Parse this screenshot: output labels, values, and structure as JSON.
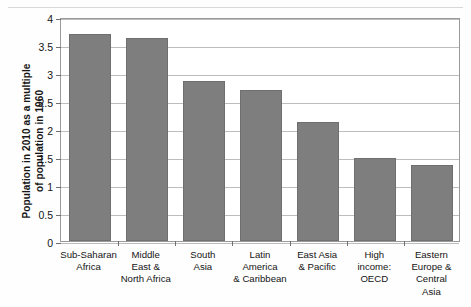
{
  "chart_data": {
    "type": "bar",
    "title": "",
    "subtitle": "",
    "xlabel": "",
    "ylabel": "Population in 2010 as a multiple of population in 1960",
    "ylabel_lines": [
      "Population in 2010 as a multiple",
      "of population in 1960"
    ],
    "ylim": [
      0,
      4
    ],
    "ytick_labels": [
      "0",
      "0.5",
      "1",
      "1.5",
      "2",
      "2.5",
      "3",
      "3.5",
      "4"
    ],
    "ytick_values": [
      0,
      0.5,
      1,
      1.5,
      2,
      2.5,
      3,
      3.5,
      4
    ],
    "grid": true,
    "legend": null,
    "bar_color": "#7e7e7e",
    "categories": [
      "Sub-Saharan Africa",
      "Middle East & North Africa",
      "South Asia",
      "Latin America & Caribbean",
      "East Asia & Pacific",
      "High income: OECD",
      "Eastern Europe & Central Asia"
    ],
    "category_lines": [
      [
        "Sub-Saharan",
        "Africa"
      ],
      [
        "Middle",
        "East &",
        "North Africa"
      ],
      [
        "South",
        "Asia"
      ],
      [
        "Latin",
        "America",
        "& Caribbean"
      ],
      [
        "East Asia",
        "& Pacific"
      ],
      [
        "High",
        "income:",
        "OECD"
      ],
      [
        "Eastern",
        "Europe &",
        "Central",
        "Asia"
      ]
    ],
    "values": [
      3.7,
      3.63,
      2.85,
      2.7,
      2.12,
      1.48,
      1.36
    ]
  }
}
